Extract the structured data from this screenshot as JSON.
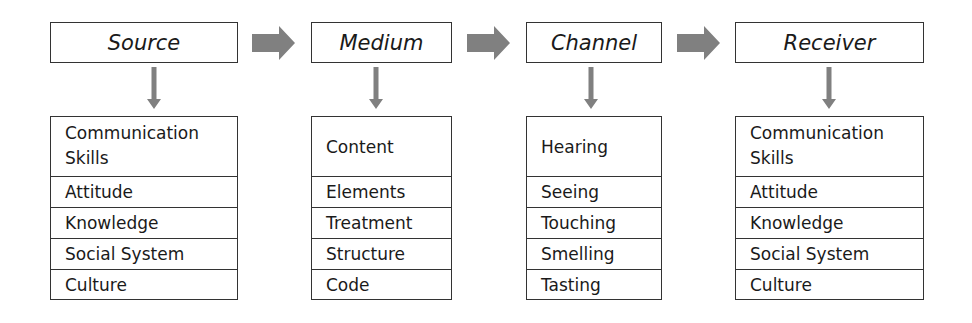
{
  "diagram": {
    "title": "",
    "colors": {
      "arrow": "#808080",
      "border": "#333333",
      "text": "#1a1a1a"
    },
    "stages": [
      {
        "label": "Source",
        "items": [
          "Communication Skills",
          "Attitude",
          "Knowledge",
          "Social System",
          "Culture"
        ]
      },
      {
        "label": "Medium",
        "items": [
          "Content",
          "Elements",
          "Treatment",
          "Structure",
          "Code"
        ]
      },
      {
        "label": "Channel",
        "items": [
          "Hearing",
          "Seeing",
          "Touching",
          "Smelling",
          "Tasting"
        ]
      },
      {
        "label": "Receiver",
        "items": [
          "Communication Skills",
          "Attitude",
          "Knowledge",
          "Social System",
          "Culture"
        ]
      }
    ],
    "flow_arrows": [
      {
        "from": "Source",
        "to": "Medium",
        "icon": "right-arrow-icon"
      },
      {
        "from": "Medium",
        "to": "Channel",
        "icon": "right-arrow-icon"
      },
      {
        "from": "Channel",
        "to": "Receiver",
        "icon": "right-arrow-icon"
      }
    ]
  }
}
